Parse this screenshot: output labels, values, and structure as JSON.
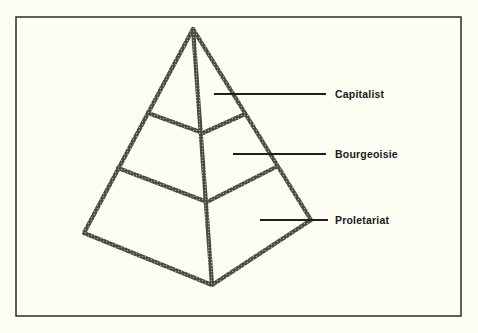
{
  "diagram": {
    "type": "pyramid",
    "frame": {
      "x": 16,
      "y": 17,
      "width": 445,
      "height": 299,
      "stroke": "#2a2a2a"
    },
    "colors": {
      "background": "#fdfdf4",
      "pyramid_stroke": "#3d3d3d",
      "pyramid_dots": "#9a9a8e",
      "leader_line": "#1e1e1e",
      "text": "#1a1a1a"
    },
    "pyramid": {
      "apex": [
        193,
        29
      ],
      "tier1": {
        "left": [
          148,
          113
        ],
        "center": [
          203,
          133
        ],
        "right": [
          245,
          114
        ]
      },
      "tier2": {
        "left": [
          118,
          168
        ],
        "center": [
          207,
          202
        ],
        "right": [
          276,
          167
        ]
      },
      "base": {
        "left": [
          84,
          233
        ],
        "center": [
          212,
          285
        ],
        "right": [
          311,
          220
        ]
      }
    },
    "tiers": [
      {
        "label": "Capitalist",
        "leader": {
          "x1": 214,
          "x2": 326,
          "y": 94
        },
        "text_pos": {
          "x": 335,
          "y": 88
        }
      },
      {
        "label": "Bourgeoisie",
        "leader": {
          "x1": 233,
          "x2": 326,
          "y": 154
        },
        "text_pos": {
          "x": 335,
          "y": 148
        }
      },
      {
        "label": "Proletariat",
        "leader": {
          "x1": 260,
          "x2": 328,
          "y": 220
        },
        "text_pos": {
          "x": 335,
          "y": 214
        }
      }
    ]
  }
}
